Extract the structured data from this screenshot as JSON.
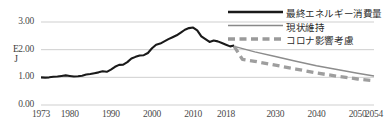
{
  "axis": {
    "y_unit_line1": "E",
    "y_unit_line2": "J",
    "y_ticks": [
      "0.00",
      "1.00",
      "2.00",
      "3.00"
    ],
    "x_ticks": [
      "1973",
      "1980",
      "1990",
      "2000",
      "2010",
      "2018",
      "2030",
      "2040",
      "2050",
      "2054"
    ]
  },
  "legend": {
    "items": [
      {
        "label": "最終エネルギー消費量",
        "style": "solid-thick",
        "color": "#1a1a1a"
      },
      {
        "label": "現状維持",
        "style": "solid-thin",
        "color": "#888888"
      },
      {
        "label": "コロナ影響考慮",
        "style": "dashed-thick",
        "color": "#9a9a9a"
      }
    ]
  },
  "colors": {
    "historical": "#1a1a1a",
    "baseline": "#8c8c8c",
    "covid": "#9e9e9e",
    "gridline": "#c9c9c9",
    "text": "#4a4a4a"
  },
  "chart_data": {
    "type": "line",
    "title": "",
    "xlabel": "",
    "ylabel": "EJ",
    "xlim": [
      1973,
      2054
    ],
    "ylim": [
      0.0,
      3.0
    ],
    "grid": true,
    "legend_position": "top-right",
    "series": [
      {
        "name": "最終エネルギー消費量",
        "style": "solid-thick",
        "color": "#1a1a1a",
        "x": [
          1973,
          1974,
          1975,
          1976,
          1977,
          1978,
          1979,
          1980,
          1981,
          1982,
          1983,
          1984,
          1985,
          1986,
          1987,
          1988,
          1989,
          1990,
          1991,
          1992,
          1993,
          1994,
          1995,
          1996,
          1997,
          1998,
          1999,
          2000,
          2001,
          2002,
          2003,
          2004,
          2005,
          2006,
          2007,
          2008,
          2009,
          2010,
          2011,
          2012,
          2013,
          2014,
          2015,
          2016,
          2017,
          2018,
          2019,
          2020
        ],
        "y": [
          1.0,
          0.99,
          1.0,
          1.02,
          1.03,
          1.05,
          1.07,
          1.05,
          1.03,
          1.04,
          1.06,
          1.1,
          1.12,
          1.15,
          1.18,
          1.22,
          1.2,
          1.28,
          1.38,
          1.45,
          1.46,
          1.55,
          1.68,
          1.74,
          1.79,
          1.8,
          1.88,
          2.05,
          2.18,
          2.22,
          2.3,
          2.38,
          2.45,
          2.52,
          2.62,
          2.72,
          2.78,
          2.8,
          2.7,
          2.48,
          2.38,
          2.28,
          2.33,
          2.3,
          2.24,
          2.18,
          2.12,
          2.15
        ]
      },
      {
        "name": "現状維持",
        "style": "solid-thin",
        "color": "#8c8c8c",
        "x": [
          2020,
          2025,
          2030,
          2035,
          2040,
          2045,
          2050,
          2054
        ],
        "y": [
          2.12,
          1.92,
          1.75,
          1.58,
          1.42,
          1.28,
          1.15,
          1.05
        ]
      },
      {
        "name": "コロナ影響考慮",
        "style": "dashed-thick",
        "color": "#9e9e9e",
        "x": [
          2020,
          2022,
          2025,
          2030,
          2035,
          2040,
          2045,
          2050,
          2054
        ],
        "y": [
          2.12,
          1.65,
          1.58,
          1.44,
          1.3,
          1.16,
          1.04,
          0.94,
          0.88
        ]
      }
    ]
  }
}
